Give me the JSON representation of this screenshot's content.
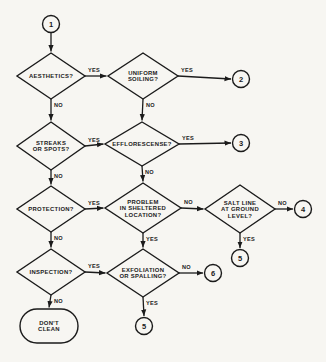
{
  "figure": {
    "background": "#f7f6f2",
    "ink": "#1b1b1b",
    "nodes": [
      {
        "id": "start",
        "type": "circle",
        "label": "1",
        "x": 51,
        "y": 24,
        "r": 8.5
      },
      {
        "id": "aesthetics",
        "type": "diamond",
        "lines": [
          "AESTHETICS?"
        ],
        "x": 51,
        "y": 76,
        "w": 68,
        "h": 46
      },
      {
        "id": "uniform-soiling",
        "type": "diamond",
        "lines": [
          "UNIFORM",
          "SOILING?"
        ],
        "x": 143,
        "y": 76,
        "w": 70,
        "h": 46
      },
      {
        "id": "out-2",
        "type": "circle",
        "label": "2",
        "x": 241,
        "y": 79,
        "r": 8.5
      },
      {
        "id": "streaks-spots",
        "type": "diamond",
        "lines": [
          "STREAKS",
          "OR SPOTS?"
        ],
        "x": 51,
        "y": 146,
        "w": 68,
        "h": 48
      },
      {
        "id": "efflorescense",
        "type": "diamond",
        "lines": [
          "EFFLORESCENSE?"
        ],
        "x": 142,
        "y": 144,
        "w": 74,
        "h": 44
      },
      {
        "id": "out-3",
        "type": "circle",
        "label": "3",
        "x": 241,
        "y": 143,
        "r": 8.5
      },
      {
        "id": "protection",
        "type": "diamond",
        "lines": [
          "PROTECTION?"
        ],
        "x": 51,
        "y": 209,
        "w": 68,
        "h": 46
      },
      {
        "id": "problem-sheltered",
        "type": "diamond",
        "lines": [
          "PROBLEM",
          "IN SHELTERED",
          "LOCATION?"
        ],
        "x": 143,
        "y": 208,
        "w": 76,
        "h": 50
      },
      {
        "id": "salt-line",
        "type": "diamond",
        "lines": [
          "SALT LINE",
          "AT GROUND",
          "LEVEL?"
        ],
        "x": 240,
        "y": 209,
        "w": 70,
        "h": 48
      },
      {
        "id": "out-4",
        "type": "circle",
        "label": "4",
        "x": 303,
        "y": 209,
        "r": 8.5
      },
      {
        "id": "out-5a",
        "type": "circle",
        "label": "5",
        "x": 240,
        "y": 258,
        "r": 8.5
      },
      {
        "id": "inspection",
        "type": "diamond",
        "lines": [
          "INSPECTION?"
        ],
        "x": 51,
        "y": 272,
        "w": 68,
        "h": 46
      },
      {
        "id": "exfoliation",
        "type": "diamond",
        "lines": [
          "EXFOLIATION",
          "OR SPALLING?"
        ],
        "x": 143,
        "y": 273,
        "w": 72,
        "h": 48
      },
      {
        "id": "out-6",
        "type": "circle",
        "label": "6",
        "x": 213,
        "y": 273,
        "r": 8.5
      },
      {
        "id": "out-5b",
        "type": "circle",
        "label": "5",
        "x": 144,
        "y": 326,
        "r": 8.5
      },
      {
        "id": "dont-clean",
        "type": "terminal",
        "lines": [
          "DON'T",
          "CLEAN"
        ],
        "x": 49,
        "y": 326,
        "w": 58,
        "h": 34
      }
    ],
    "edges": [
      {
        "from": "start",
        "to": "aesthetics",
        "dir": "down",
        "label": ""
      },
      {
        "from": "aesthetics",
        "to": "uniform-soiling",
        "dir": "right",
        "label": "YES"
      },
      {
        "from": "uniform-soiling",
        "to": "out-2",
        "dir": "right",
        "label": "YES"
      },
      {
        "from": "aesthetics",
        "to": "streaks-spots",
        "dir": "down",
        "label": "NO"
      },
      {
        "from": "uniform-soiling",
        "to": "efflorescense",
        "dir": "down",
        "label": "NO"
      },
      {
        "from": "streaks-spots",
        "to": "efflorescense",
        "dir": "right",
        "label": "YES"
      },
      {
        "from": "efflorescense",
        "to": "out-3",
        "dir": "right",
        "label": "YES"
      },
      {
        "from": "streaks-spots",
        "to": "protection",
        "dir": "down",
        "label": "NO"
      },
      {
        "from": "efflorescense",
        "to": "problem-sheltered",
        "dir": "down",
        "label": "NO"
      },
      {
        "from": "protection",
        "to": "problem-sheltered",
        "dir": "right",
        "label": "YES"
      },
      {
        "from": "problem-sheltered",
        "to": "salt-line",
        "dir": "right",
        "label": "NO"
      },
      {
        "from": "salt-line",
        "to": "out-4",
        "dir": "right",
        "label": "NO"
      },
      {
        "from": "salt-line",
        "to": "out-5a",
        "dir": "down",
        "label": "YES"
      },
      {
        "from": "problem-sheltered",
        "to": "exfoliation",
        "dir": "down",
        "label": "YES"
      },
      {
        "from": "protection",
        "to": "inspection",
        "dir": "down",
        "label": "NO"
      },
      {
        "from": "inspection",
        "to": "exfoliation",
        "dir": "right",
        "label": "YES"
      },
      {
        "from": "exfoliation",
        "to": "out-6",
        "dir": "right",
        "label": "NO"
      },
      {
        "from": "exfoliation",
        "to": "out-5b",
        "dir": "down",
        "label": "YES"
      },
      {
        "from": "inspection",
        "to": "dont-clean",
        "dir": "down",
        "label": "NO"
      }
    ]
  }
}
